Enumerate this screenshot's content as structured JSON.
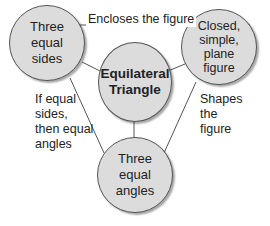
{
  "diagram": {
    "center": {
      "label": "Equilateral Triangle",
      "line1": "Equilateral",
      "line2": "Triangle"
    },
    "nodes": [
      {
        "id": "top-left",
        "lines": [
          "Three",
          "equal",
          "sides"
        ]
      },
      {
        "id": "top-right",
        "lines": [
          "Closed,",
          "simple,",
          "plane",
          "figure"
        ]
      },
      {
        "id": "bottom",
        "lines": [
          "Three",
          "equal",
          "angles"
        ]
      }
    ],
    "edges": [
      {
        "from": "top-left",
        "to": "top-right",
        "label": "Encloses the figure"
      },
      {
        "from": "top-left",
        "to": "bottom",
        "label_lines": [
          "If equal",
          "sides,",
          "then equal",
          "angles"
        ]
      },
      {
        "from": "top-right",
        "to": "bottom",
        "label_lines": [
          "Shapes",
          "the",
          "figure"
        ]
      },
      {
        "from": "center",
        "to": "top-left"
      },
      {
        "from": "center",
        "to": "top-right"
      },
      {
        "from": "center",
        "to": "bottom"
      }
    ],
    "colors": {
      "circle_fill": "#dcdcdc",
      "circle_border": "#555555",
      "line": "#555555",
      "text": "#222222"
    }
  }
}
